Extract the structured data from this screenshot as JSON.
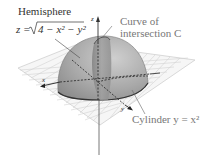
{
  "diagram": {
    "hemisphere_label": "Hemisphere",
    "hemisphere_eq_lhs": "z = ",
    "hemisphere_eq_rhs": "4 − x² − y²",
    "curve_label_line1": "Curve of",
    "curve_label_line2": "intersection C",
    "cylinder_label": "Cylinder y = x²",
    "axis_z": "z",
    "axis_x": "x",
    "axis_y": "y"
  },
  "colors": {
    "surface": "#9a9a9a",
    "grid": "#cfcfcf",
    "text_dark": "#333333",
    "text_gray": "#777777"
  }
}
